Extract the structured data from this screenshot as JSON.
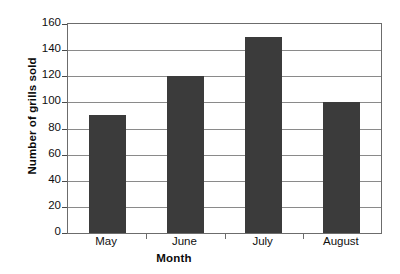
{
  "chart_data": {
    "type": "bar",
    "title": "",
    "categories": [
      "May",
      "June",
      "July",
      "August"
    ],
    "values": [
      90,
      120,
      150,
      100
    ],
    "series": [
      {
        "name": "Number of grills sold",
        "values": [
          90,
          120,
          150,
          100
        ]
      }
    ],
    "xlabel": "Month",
    "ylabel": "Number of grills sold",
    "ylim": [
      0,
      160
    ],
    "ytick_step": 20,
    "yticks": [
      0,
      20,
      40,
      60,
      80,
      100,
      120,
      140,
      160
    ],
    "ytick_labels": [
      "0",
      "20",
      "40",
      "60",
      "80",
      "100",
      "120",
      "140",
      "160"
    ],
    "grid": true,
    "grid_axis": "y",
    "legend": false,
    "legend_position": "none",
    "bar_color": "#3b3b3b",
    "grid_color": "#8a8a8a",
    "axis_color": "#6c6c6c",
    "background_color": "#ffffff"
  }
}
